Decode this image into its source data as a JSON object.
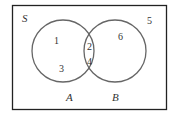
{
  "diagram": {
    "type": "venn",
    "universe_label": "S",
    "sets": [
      {
        "label": "A",
        "elements_only": [
          "1",
          "3"
        ]
      },
      {
        "label": "B",
        "elements_only": [
          "6"
        ]
      }
    ],
    "intersection": [
      "2",
      "4"
    ],
    "outside": [
      "5"
    ],
    "colors": {
      "stroke": "#555555",
      "border": "#222222",
      "text": "#333333"
    }
  }
}
